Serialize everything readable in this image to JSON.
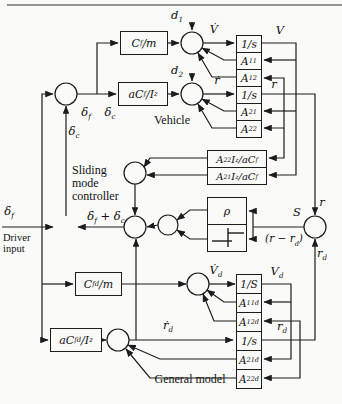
{
  "colors": {
    "wire": "#1c1c1c",
    "paper": "#fafaf8"
  },
  "texts": {
    "vehicle": "Vehicle",
    "sliding": "Sliding",
    "mode": "mode",
    "controller": "controller",
    "driver": "Driver",
    "input": "input",
    "general_model": "General model"
  },
  "blocks": {
    "cf_m": {
      "p1": "C",
      "s1": "f",
      "p2": "/m"
    },
    "acf_iz": {
      "p1": "aC",
      "s1": "f",
      "p2": "/I",
      "s2": "z"
    },
    "int_v": {
      "p1": "1/s"
    },
    "a11": {
      "p1": "A",
      "s1": "11"
    },
    "a12": {
      "p1": "A",
      "s1": "12"
    },
    "int_r": {
      "p1": "1/s"
    },
    "a21": {
      "p1": "A",
      "s1": "21"
    },
    "a22": {
      "p1": "A",
      "s1": "22"
    },
    "a22iz": {
      "p1": "A",
      "s1": "22",
      "p2": "I",
      "s2": "z",
      "p3": "/aC",
      "s3": "f"
    },
    "a21iz": {
      "p1": "A",
      "s1": "21",
      "p2": "I",
      "s2": "z",
      "p3": "/aC",
      "s3": "f"
    },
    "rho": {
      "p1": "ρ"
    },
    "cfd_m": {
      "p1": "C",
      "s1": "fd",
      "p2": "/m"
    },
    "acfd_iz": {
      "p1": "aC",
      "s1": "fd",
      "p2": "/I",
      "s2": "z"
    },
    "int_vd": {
      "p1": "1/S"
    },
    "a11d": {
      "p1": "A",
      "s1": "11d"
    },
    "a12d": {
      "p1": "A",
      "s1": "12d"
    },
    "int_rd": {
      "p1": "1/s"
    },
    "a21d": {
      "p1": "A",
      "s1": "21d"
    },
    "a22d": {
      "p1": "A",
      "s1": "22d"
    }
  },
  "signals": {
    "d1": {
      "p1": "d",
      "s1": "1"
    },
    "d2": {
      "p1": "d",
      "s1": "2"
    },
    "vdot": {
      "p1": "V̇"
    },
    "v": {
      "p1": "V"
    },
    "rdot": {
      "p1": "ṙ"
    },
    "r_top": {
      "p1": "r"
    },
    "r_right": {
      "p1": "r"
    },
    "delta_f_top": {
      "p1": "δ",
      "s1": "f"
    },
    "delta_c_top": {
      "p1": "δ",
      "s1": "c"
    },
    "delta_c_mid": {
      "p1": "δ",
      "s1": "c"
    },
    "delta_f_driver": {
      "p1": "δ",
      "s1": "f"
    },
    "delta_sum": {
      "p1": "δ",
      "s1": "f",
      "p2": " + δ",
      "s2": "c"
    },
    "s": {
      "p1": "S"
    },
    "r_minus_rd": {
      "p1": "(r − r",
      "s1": "d",
      "p2": ")"
    },
    "rd_right": {
      "p1": "r",
      "s1": "d"
    },
    "vdot_d": {
      "p1": "V̇",
      "s1": "d"
    },
    "v_d": {
      "p1": "V",
      "s1": "d"
    },
    "rdot_d": {
      "p1": "ṙ",
      "s1": "d"
    },
    "rd_mid": {
      "p1": "r",
      "s1": "d"
    }
  }
}
